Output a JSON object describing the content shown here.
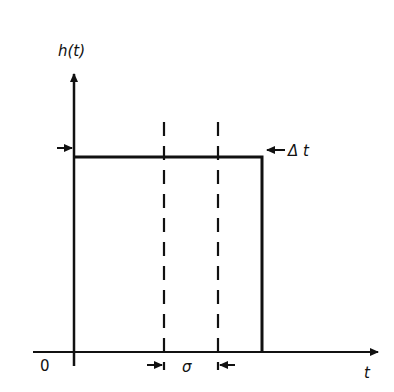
{
  "diagram": {
    "y_axis_label": "h(t)",
    "x_axis_label": "t",
    "origin_label": "0",
    "pulse_width_label": "Δ t",
    "gap_label": "σ",
    "line_color": "#111111",
    "background": "#ffffff",
    "elements": {
      "pulse": {
        "shape": "rectangular",
        "height_y": 157,
        "start_x": 74,
        "end_x": 262
      },
      "dashed_lines_x": [
        164,
        218
      ],
      "baseline_y": 352
    }
  }
}
